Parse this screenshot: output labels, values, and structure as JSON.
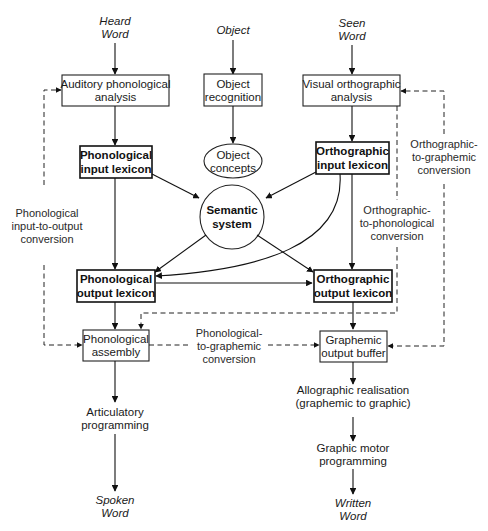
{
  "header": {
    "text": ""
  },
  "inputs": {
    "heard_word": [
      "Heard",
      "Word"
    ],
    "object": "Object",
    "seen_word": [
      "Seen",
      "Word"
    ]
  },
  "outputs": {
    "spoken_word": [
      "Spoken",
      "Word"
    ],
    "written_word": [
      "Written",
      "Word"
    ]
  },
  "boxes": {
    "auditory": [
      "Auditory phonological",
      "analysis"
    ],
    "object_recognition": [
      "Object",
      "recognition"
    ],
    "visual": [
      "Visual orthographic",
      "analysis"
    ],
    "phon_input": [
      "Phonological",
      "input lexicon"
    ],
    "orth_input": [
      "Orthographic",
      "input lexicon"
    ],
    "object_concepts": [
      "Object",
      "concepts"
    ],
    "semantic": [
      "Semantic",
      "system"
    ],
    "phon_output": [
      "Phonological",
      "output lexicon"
    ],
    "orth_output": [
      "Orthographic",
      "output lexicon"
    ],
    "phon_assembly": [
      "Phonological",
      "assembly"
    ],
    "graphemic_buffer": [
      "Graphemic",
      "output buffer"
    ]
  },
  "processes": {
    "articulatory": [
      "Articulatory",
      "programming"
    ],
    "allographic": [
      "Allographic realisation",
      "(graphemic to graphic)"
    ],
    "graphic_motor": [
      "Graphic motor",
      "programming"
    ]
  },
  "conversions": {
    "phon_in_out": [
      "Phonological",
      "input-to-output",
      "conversion"
    ],
    "orth_to_phon": [
      "Orthographic-",
      "to-phonological",
      "conversion"
    ],
    "orth_to_graph": [
      "Orthographic-",
      "to-graphemic",
      "conversion"
    ],
    "phon_to_graph": [
      "Phonological-",
      "to-graphemic",
      "conversion"
    ]
  }
}
